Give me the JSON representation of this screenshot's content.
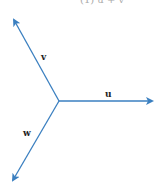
{
  "diagram": {
    "caption": "(1)  u + v",
    "color": "#3a7fc0",
    "origin": [
      59,
      101
    ],
    "vectors": [
      {
        "name": "u",
        "label": "u",
        "tip": [
          154,
          101
        ],
        "label_pos": [
          105,
          90
        ]
      },
      {
        "name": "v",
        "label": "v",
        "tip": [
          13,
          18
        ],
        "label_pos": [
          42,
          52
        ]
      },
      {
        "name": "w",
        "label": "w",
        "tip": [
          12,
          182
        ],
        "label_pos": [
          24,
          128
        ]
      }
    ]
  }
}
